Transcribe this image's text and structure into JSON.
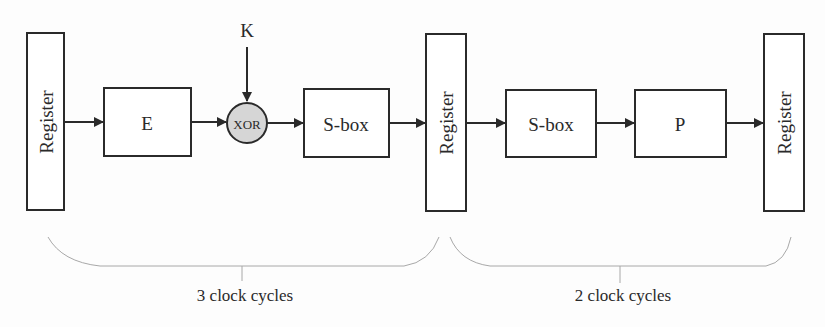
{
  "diagram": {
    "registers": [
      {
        "label": "Register"
      },
      {
        "label": "Register"
      },
      {
        "label": "Register"
      }
    ],
    "stage1": {
      "e_box": "E",
      "xor": "XOR",
      "key": "K",
      "sbox": "S-box",
      "cycles_label": "3 clock cycles"
    },
    "stage2": {
      "sbox": "S-box",
      "p_box": "P",
      "cycles_label": "2 clock cycles"
    },
    "colors": {
      "stroke": "#2a2a2a",
      "xor_fill": "#d6d6d6",
      "brace": "#a8a8a8"
    }
  }
}
